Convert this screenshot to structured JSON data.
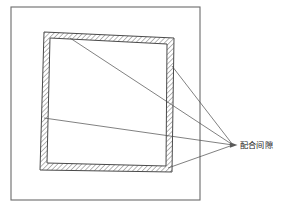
{
  "figure": {
    "type": "engineering-cross-section-diagram",
    "background_color": "#ffffff",
    "width": 286,
    "height": 212,
    "line_color": "#5a5a5a",
    "hatch_color": "#3d3d3d",
    "leader_color": "#4a4a4a",
    "text_color": "#1b1b1b"
  },
  "outer_frame": {
    "name": "outer-boundary-rectangle",
    "x": 11,
    "y": 7,
    "width": 189,
    "height": 193,
    "stroke_color": "#6b6b6b",
    "stroke_width": 1.1,
    "fill": "none"
  },
  "hatched_ring": {
    "name": "hatched-wall-quadrilateral",
    "description": "tilted square ring with diagonal hatching representing material wall",
    "outer_points": "44,32 174,38 172,172 40,170",
    "inner_points": "50,38 167,44 166,166 47,163",
    "hatch_spacing": 3.4,
    "hatch_angle_deg": 45,
    "stroke_color": "#4a4a4a",
    "stroke_width": 1.0
  },
  "leaders": {
    "name": "leader-lines",
    "converge_point": {
      "x": 233,
      "y": 145
    },
    "arrow_head": {
      "x": 233,
      "y": 145,
      "size": 4.5
    },
    "lines": [
      {
        "name": "leader-top-band",
        "x1": 70,
        "y1": 38,
        "x2": 233,
        "y2": 145
      },
      {
        "name": "leader-right-band",
        "x1": 172,
        "y1": 66,
        "x2": 233,
        "y2": 145
      },
      {
        "name": "leader-left-band",
        "x1": 44,
        "y1": 118,
        "x2": 233,
        "y2": 145
      },
      {
        "name": "leader-bottom-band",
        "x1": 168,
        "y1": 168,
        "x2": 233,
        "y2": 145
      }
    ]
  },
  "annotation": {
    "name": "fit-clearance-label",
    "text": "配合间隙",
    "x": 240,
    "y": 145,
    "font_size": 8.2,
    "color": "#1b1b1b"
  }
}
